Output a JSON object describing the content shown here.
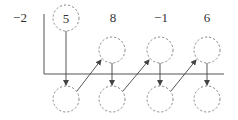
{
  "diagram": {
    "type": "synthetic-division",
    "divisor": "−2",
    "coefficients": [
      "5",
      "8",
      "−1",
      "6"
    ],
    "middle_row_blanks": 3,
    "bottom_row_blanks": 4,
    "colors": {
      "text": "#333333",
      "circle_stroke": "#888888",
      "rule": "#555555",
      "arrow": "#444444"
    }
  }
}
